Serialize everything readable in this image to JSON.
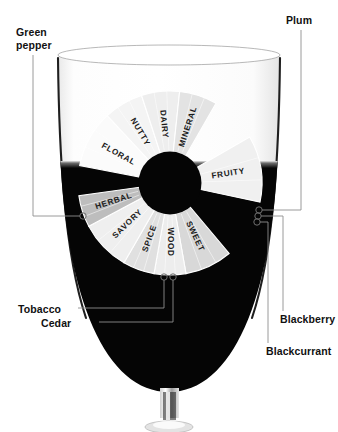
{
  "figure": {
    "kind": "wine-aroma-wheel-over-glass",
    "background_color": "#ffffff",
    "ink_color": "#111111",
    "callout_line_color": "#8a8a8a",
    "wine_color": "#050505",
    "glass_outline_color": "#2b2b2b"
  },
  "callouts": [
    {
      "id": "green-pepper",
      "label": "Green\npepper",
      "side": "left",
      "anchor_x": 83,
      "anchor_y": 216
    },
    {
      "id": "plum",
      "label": "Plum",
      "side": "right",
      "anchor_x": 259,
      "anchor_y": 210
    },
    {
      "id": "tobacco",
      "label": "Tobacco",
      "side": "bottom-left",
      "anchor_x": 164,
      "anchor_y": 277
    },
    {
      "id": "cedar",
      "label": "Cedar",
      "side": "bottom-left",
      "anchor_x": 173,
      "anchor_y": 277
    },
    {
      "id": "blackberry",
      "label": "Blackberry",
      "side": "bottom-right",
      "anchor_x": 258,
      "anchor_y": 216
    },
    {
      "id": "blackcurrant",
      "label": "Blackcurrant",
      "side": "bottom-right",
      "anchor_x": 257,
      "anchor_y": 222
    }
  ],
  "chart_data": {
    "type": "pie",
    "title": "",
    "subtitle": "",
    "legend_position": "none",
    "grid": false,
    "center_x": 170,
    "center_y": 183,
    "inner_radius": 31,
    "outer_radius": 92,
    "start_angle_deg": -180,
    "end_angle_deg": 0,
    "orientation": "upper-half-plus-lower-half-ring",
    "categories": [
      "NUTTY",
      "DAIRY",
      "MINERAL",
      "FRUITY",
      "SWEET",
      "WOOD",
      "SPICE",
      "SAVORY",
      "HERBAL",
      "FLORAL"
    ],
    "values": [
      1,
      1,
      1,
      1,
      1,
      1,
      1,
      1,
      1,
      1
    ],
    "segments": [
      {
        "label": "FLORAL",
        "start_deg": 191,
        "end_deg": 227,
        "shade": "#fbfbfb",
        "text_rotation_deg": -31
      },
      {
        "label": "NUTTY",
        "start_deg": 227,
        "end_deg": 252,
        "shade": "#f4f4f4",
        "text_rotation_deg": -61
      },
      {
        "label": "DAIRY",
        "start_deg": 252,
        "end_deg": 276,
        "shade": "#eeeeee",
        "text_rotation_deg": -86
      },
      {
        "label": "MINERAL",
        "start_deg": 276,
        "end_deg": 300,
        "shade": "#e3e3e3",
        "text_rotation_deg": -109
      },
      {
        "label": "FRUITY",
        "start_deg": 330,
        "end_deg": 372,
        "shade": "#f0f0f0",
        "text_rotation_deg": 31
      },
      {
        "label": "SWEET",
        "start_deg": 50,
        "end_deg": 80,
        "shade": "#d8d8d8",
        "text_rotation_deg": 65
      },
      {
        "label": "WOOD",
        "start_deg": 80,
        "end_deg": 100,
        "shade": "#ededed",
        "text_rotation_deg": 90
      },
      {
        "label": "SPICE",
        "start_deg": 100,
        "end_deg": 120,
        "shade": "#e0e0e0",
        "text_rotation_deg": 110
      },
      {
        "label": "SAVORY",
        "start_deg": 120,
        "end_deg": 152,
        "shade": "#efefef",
        "text_rotation_deg": 136
      },
      {
        "label": "HERBAL",
        "start_deg": 152,
        "end_deg": 172,
        "shade": "#bdbdbd",
        "text_rotation_deg": 162
      }
    ],
    "xlabel": "",
    "ylabel": ""
  }
}
